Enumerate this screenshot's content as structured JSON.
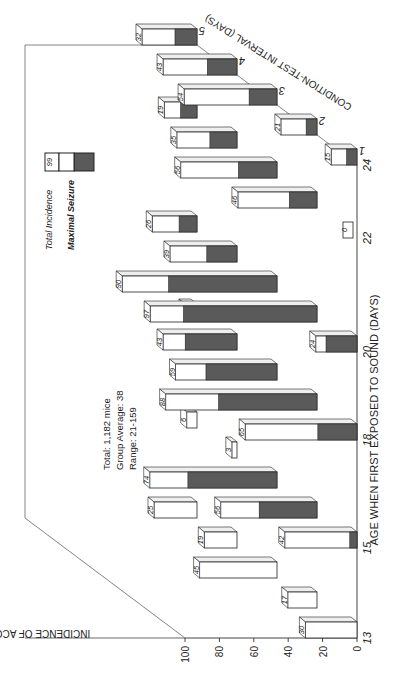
{
  "chart_data": {
    "type": "bar",
    "subtype": "3d-grouped-bar (rotated 90°)",
    "title": "",
    "xlabel": "AGE WHEN FIRST EXPOSED TO SOUND (DAYS)",
    "ylabel": "INCIDENCE OF ACCR (%)",
    "zlabel": "CONDITION-TEST INTERVAL (DAYS)",
    "categories": [
      "13",
      "15",
      "18",
      "20",
      "22",
      "24"
    ],
    "y_ticks": [
      "0",
      "20",
      "40",
      "60",
      "80",
      "100"
    ],
    "z_ticks": [
      "1",
      "2",
      "3",
      "4",
      "5"
    ],
    "ylim": [
      0,
      100
    ],
    "legend": [
      {
        "name": "Total Incidence",
        "sample_value": "99",
        "color": "#ffffff"
      },
      {
        "name": "Maximal Seizure",
        "color": "#555555"
      }
    ],
    "series": [
      {
        "name": "Interval 1 day - Total Incidence",
        "values": [
          30,
          42,
          65,
          24,
          0,
          15
        ]
      },
      {
        "name": "Interval 2 days - Total Incidence",
        "values": [
          17,
          56,
          88,
          97,
          46,
          21
        ]
      },
      {
        "name": "Interval 3 days - Total Incidence",
        "values": [
          45,
          74,
          59,
          90,
          56,
          54
        ]
      },
      {
        "name": "Interval 4 days - Total Incidence",
        "values": [
          19,
          3,
          43,
          39,
          35,
          43
        ]
      },
      {
        "name": "Interval 5 days - Total Incidence",
        "values": [
          25,
          6,
          7,
          26,
          19,
          32
        ]
      }
    ],
    "annotation": {
      "line1": "Total: 1,182 mice",
      "line2": "Group Average: 38",
      "line3": "Range: 21-159"
    },
    "grid": false,
    "legend_position": "upper-right (in rotated frame)"
  }
}
